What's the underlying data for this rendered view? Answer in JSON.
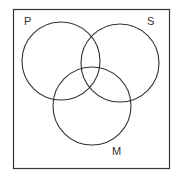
{
  "diagram": {
    "type": "venn",
    "sets": [
      {
        "label": "P",
        "cx": 61,
        "cy": 61,
        "r": 39
      },
      {
        "label": "S",
        "cx": 120,
        "cy": 63,
        "r": 39
      },
      {
        "label": "M",
        "cx": 92,
        "cy": 106,
        "r": 39
      }
    ],
    "labels": {
      "p": "P",
      "s": "S",
      "m": "M"
    },
    "stroke_color": "#333333"
  }
}
